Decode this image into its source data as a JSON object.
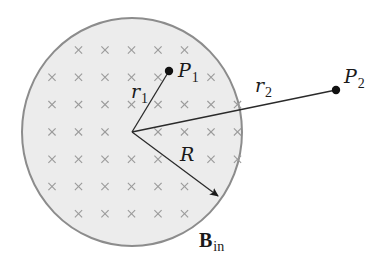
{
  "diagram": {
    "field_region": {
      "label_main": "B",
      "label_sub": "in",
      "fill_color": "#ececec",
      "border_color": "#8c8c8c",
      "symbol": "x (field into page)",
      "cross_grid": [
        {
          "row": 1,
          "cols": [
            2,
            3,
            4,
            5,
            6
          ]
        },
        {
          "row": 2,
          "cols": [
            1,
            2,
            3,
            4,
            5,
            7
          ]
        },
        {
          "row": 3,
          "cols": [
            1,
            2,
            3,
            4,
            5,
            6,
            7,
            8
          ]
        },
        {
          "row": 4,
          "cols": [
            1,
            2,
            3,
            5,
            6,
            7,
            8
          ]
        },
        {
          "row": 5,
          "cols": [
            1,
            2,
            3,
            4,
            5,
            7,
            8
          ]
        },
        {
          "row": 6,
          "cols": [
            1,
            2,
            3,
            4,
            5,
            6
          ]
        },
        {
          "row": 7,
          "cols": [
            2,
            3,
            4,
            5,
            6
          ]
        }
      ]
    },
    "radius_label": "R",
    "point1": {
      "label": "P",
      "sub": "1",
      "distance_label": "r",
      "distance_sub": "1",
      "location": "inside"
    },
    "point2": {
      "label": "P",
      "sub": "2",
      "distance_label": "r",
      "distance_sub": "2",
      "location": "outside"
    },
    "line_color": "#2a2a2a",
    "dot_color": "#111111"
  }
}
